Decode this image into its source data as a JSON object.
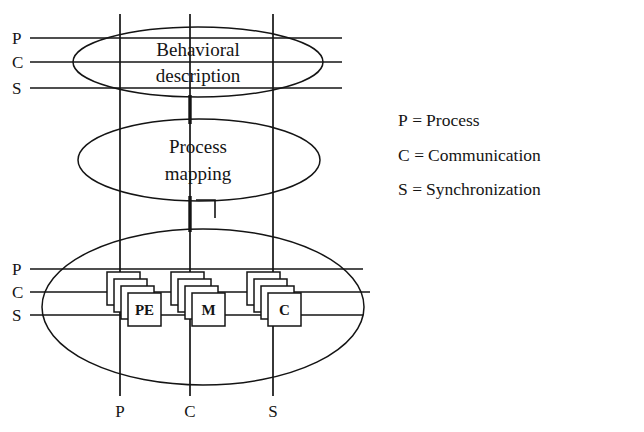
{
  "diagram": {
    "layers": [
      {
        "id": "behavioral",
        "line1": "Behavioral",
        "line2": "description"
      },
      {
        "id": "process-mapping",
        "line1": "Process",
        "line2": "mapping"
      },
      {
        "id": "architecture",
        "line1": "",
        "line2": ""
      }
    ],
    "top_axis_labels": [
      "P",
      "C",
      "S"
    ],
    "bottom_axis_side_labels": [
      "P",
      "C",
      "S"
    ],
    "bottom_axis_labels": [
      "P",
      "C",
      "S"
    ],
    "component_stacks": [
      {
        "label": "PE",
        "count": 4
      },
      {
        "label": "M",
        "count": 4
      },
      {
        "label": "C",
        "count": 4
      }
    ]
  },
  "legend": {
    "entries": [
      {
        "key": "P",
        "eq": "=",
        "value": "Process"
      },
      {
        "key": "C",
        "eq": "=",
        "value": "Communication"
      },
      {
        "key": "S",
        "eq": "=",
        "value": "Synchronization"
      }
    ]
  },
  "colors": {
    "ink": "#141414",
    "background": "#ffffff"
  }
}
